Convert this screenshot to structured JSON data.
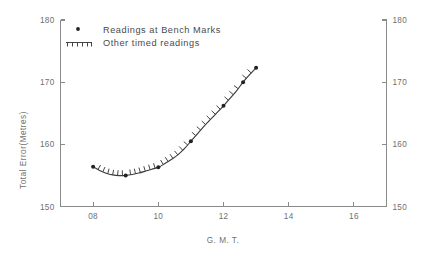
{
  "chart_data": {
    "type": "line",
    "title": "",
    "xlabel": "G. M. T.",
    "ylabel": "Total Error(Metres)",
    "xlim": [
      7.0,
      17.0
    ],
    "ylim": [
      150,
      180
    ],
    "xticks": [
      8,
      10,
      12,
      14,
      16
    ],
    "xtick_labels": [
      "08",
      "10",
      "12",
      "14",
      "16"
    ],
    "yticks": [
      150,
      160,
      170,
      180
    ],
    "ytick_labels": [
      "150",
      "160",
      "170",
      "180"
    ],
    "ytick_labels_right": [
      "150",
      "160",
      "170",
      "180"
    ],
    "grid": false,
    "legend_position": "top-left-inside",
    "series": [
      {
        "name": "Readings at Bench Marks",
        "marker": "dot",
        "x": [
          8.0,
          9.0,
          10.0,
          11.0,
          12.0,
          12.6,
          13.0
        ],
        "values": [
          156.4,
          155.0,
          156.3,
          160.5,
          166.2,
          170.0,
          172.3
        ]
      },
      {
        "name": "Other timed readings",
        "marker": "hash",
        "x": [
          8.15,
          8.3,
          8.45,
          8.6,
          8.75,
          8.9,
          9.15,
          9.3,
          9.45,
          9.6,
          9.75,
          9.9,
          10.15,
          10.3,
          10.45,
          10.6,
          10.75,
          10.9,
          11.15,
          11.3,
          11.45,
          11.6,
          11.75,
          11.9,
          12.15,
          12.3,
          12.45,
          12.7,
          12.85
        ],
        "values": [
          155.9,
          155.5,
          155.25,
          155.05,
          155.0,
          154.95,
          155.1,
          155.3,
          155.5,
          155.75,
          156.0,
          156.15,
          156.7,
          157.2,
          157.7,
          158.3,
          159.0,
          159.7,
          161.3,
          162.2,
          163.1,
          164.0,
          164.9,
          165.6,
          166.9,
          167.8,
          168.6,
          170.6,
          171.5
        ]
      }
    ],
    "curve_points": [
      [
        8.0,
        156.4
      ],
      [
        8.2,
        155.8
      ],
      [
        8.4,
        155.35
      ],
      [
        8.6,
        155.08
      ],
      [
        8.8,
        154.97
      ],
      [
        9.0,
        155.0
      ],
      [
        9.2,
        155.15
      ],
      [
        9.4,
        155.38
      ],
      [
        9.6,
        155.68
      ],
      [
        9.8,
        156.0
      ],
      [
        10.0,
        156.3
      ],
      [
        10.2,
        156.9
      ],
      [
        10.4,
        157.55
      ],
      [
        10.6,
        158.3
      ],
      [
        10.8,
        159.3
      ],
      [
        11.0,
        160.5
      ],
      [
        11.2,
        161.7
      ],
      [
        11.4,
        162.9
      ],
      [
        11.6,
        164.0
      ],
      [
        11.8,
        165.1
      ],
      [
        12.0,
        166.2
      ],
      [
        12.2,
        167.4
      ],
      [
        12.4,
        168.6
      ],
      [
        12.6,
        170.0
      ],
      [
        12.8,
        171.2
      ],
      [
        13.0,
        172.3
      ]
    ]
  },
  "legend": {
    "entries": [
      {
        "label": "Readings at Bench Marks",
        "symbol": "dot-marker"
      },
      {
        "label": "Other timed readings",
        "symbol": "hash-marker"
      }
    ]
  },
  "colors": {
    "axis": "#8a8a8a",
    "tick_text": "#6f6f6f",
    "curve": "#3b3b3b",
    "marker": "#222222",
    "legend_text": "#4a4a4a",
    "background": "#ffffff"
  }
}
